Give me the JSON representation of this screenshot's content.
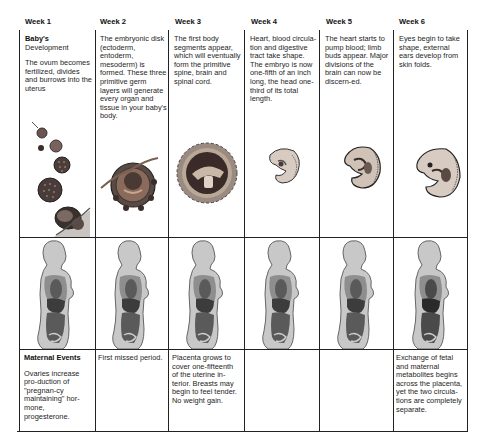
{
  "weeks": [
    {
      "label": "Week 1"
    },
    {
      "label": "Week 2"
    },
    {
      "label": "Week 3"
    },
    {
      "label": "Week 4"
    },
    {
      "label": "Week 5"
    },
    {
      "label": "Week 6"
    }
  ],
  "babys_development": {
    "heading": "Baby's",
    "subheading": "Development",
    "entries": [
      "The ovum becomes fertilized, divides and burrows into the uterus",
      "The embryonic disk (ectoderm, entoderm, mesoderm) is formed. These three primitive germ layers will generate every organ and tissue in your baby's body.",
      "The first body segments appear, which will eventually form the primitive spine, brain and spinal cord.",
      "Heart, blood circula-tion and digestive tract take shape. The embryo is now one-fifth of an inch long, the head one-third of its total length.",
      "The heart starts to pump blood; limb buds appear. Major divisions of the brain can now be discern-ed.",
      "Eyes begin to take shape, external ears develop from skin folds."
    ]
  },
  "maternal_events": {
    "heading": "Maternal Events",
    "entries": [
      "Ovaries increase pro-duction of \"pregnan-cy maintaining\" hor-mone, progesterone.",
      "First missed period.",
      "Placenta grows to cover one-fifteenth of the uterine in-terior. Breasts may begin to feel tender. No weight gain.",
      "",
      "",
      "Exchange of fetal and maternal metabolites begins across the placenta, yet the two circula-tions are completely separate."
    ]
  },
  "illustrations": {
    "embryo": [
      "ovum-division-sequence",
      "embryonic-disk",
      "body-segments-sphere",
      "embryo-week-4",
      "embryo-week-5",
      "embryo-week-6"
    ],
    "mother": [
      "mother-silhouette-week-1",
      "mother-silhouette-week-2",
      "mother-silhouette-week-3",
      "mother-silhouette-week-4",
      "mother-silhouette-week-5",
      "mother-silhouette-week-6"
    ]
  },
  "colors": {
    "grid": "#222222",
    "silhouette": "#c8c8c8",
    "organs": "#4a4a4a"
  }
}
